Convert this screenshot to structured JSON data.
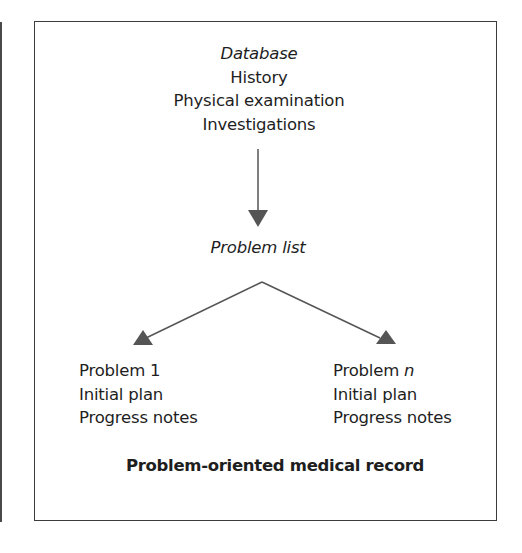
{
  "diagram": {
    "title": "Problem-oriented medical record",
    "database": {
      "heading": "Database",
      "items": [
        "History",
        "Physical examination",
        "Investigations"
      ]
    },
    "problem_list": {
      "heading": "Problem list"
    },
    "branches": [
      {
        "problem_label": "Problem 1",
        "items": [
          "Initial plan",
          "Progress notes"
        ]
      },
      {
        "problem_prefix": "Problem ",
        "problem_var": "n",
        "items": [
          "Initial plan",
          "Progress notes"
        ]
      }
    ],
    "edges": [
      {
        "from": "Database",
        "to": "Problem list"
      },
      {
        "from": "Problem list",
        "to": "Problem 1"
      },
      {
        "from": "Problem list",
        "to": "Problem n"
      }
    ]
  },
  "colors": {
    "text": "#1e1e1e",
    "arrow": "#555555",
    "frame": "#3c3c3c"
  }
}
